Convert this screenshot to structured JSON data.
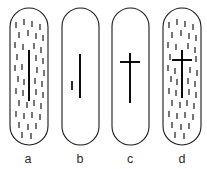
{
  "figure": {
    "background_color": "#ffffff",
    "outline_color": "#1a1a1a",
    "marker_color": "#000000",
    "texture_color": "#111111",
    "label_color": "#2b2b2b",
    "width": 207,
    "height": 169
  },
  "panels": [
    {
      "id": "a",
      "label": "a",
      "label_x": 28,
      "label_y": 163,
      "capsule": {
        "x": 10,
        "y": 8,
        "width": 38,
        "height": 137,
        "radius": 19
      },
      "has_texture": true,
      "has_center_line": true,
      "has_crossbar": false,
      "has_small_dash": false,
      "center_line": {
        "x": 29,
        "y1": 50,
        "y2": 101
      },
      "crossbar": null,
      "small_dash": null,
      "texture_dashes": [
        {
          "x": 16,
          "y1": 22,
          "y2": 28
        },
        {
          "x": 24,
          "y1": 19,
          "y2": 25
        },
        {
          "x": 32,
          "y1": 21,
          "y2": 27
        },
        {
          "x": 40,
          "y1": 24,
          "y2": 30
        },
        {
          "x": 19,
          "y1": 32,
          "y2": 38
        },
        {
          "x": 28,
          "y1": 30,
          "y2": 36
        },
        {
          "x": 36,
          "y1": 33,
          "y2": 39
        },
        {
          "x": 43,
          "y1": 35,
          "y2": 41
        },
        {
          "x": 15,
          "y1": 42,
          "y2": 48
        },
        {
          "x": 23,
          "y1": 44,
          "y2": 50
        },
        {
          "x": 34,
          "y1": 43,
          "y2": 49
        },
        {
          "x": 41,
          "y1": 47,
          "y2": 53
        },
        {
          "x": 17,
          "y1": 54,
          "y2": 60
        },
        {
          "x": 36,
          "y1": 55,
          "y2": 61
        },
        {
          "x": 43,
          "y1": 58,
          "y2": 64
        },
        {
          "x": 15,
          "y1": 65,
          "y2": 71
        },
        {
          "x": 22,
          "y1": 64,
          "y2": 70
        },
        {
          "x": 37,
          "y1": 67,
          "y2": 73
        },
        {
          "x": 44,
          "y1": 70,
          "y2": 76
        },
        {
          "x": 18,
          "y1": 76,
          "y2": 82
        },
        {
          "x": 24,
          "y1": 79,
          "y2": 85
        },
        {
          "x": 35,
          "y1": 78,
          "y2": 84
        },
        {
          "x": 42,
          "y1": 81,
          "y2": 87
        },
        {
          "x": 16,
          "y1": 88,
          "y2": 94
        },
        {
          "x": 23,
          "y1": 90,
          "y2": 96
        },
        {
          "x": 36,
          "y1": 89,
          "y2": 95
        },
        {
          "x": 43,
          "y1": 92,
          "y2": 98
        },
        {
          "x": 19,
          "y1": 100,
          "y2": 106
        },
        {
          "x": 27,
          "y1": 102,
          "y2": 108
        },
        {
          "x": 34,
          "y1": 100,
          "y2": 106
        },
        {
          "x": 41,
          "y1": 103,
          "y2": 109
        },
        {
          "x": 16,
          "y1": 111,
          "y2": 117
        },
        {
          "x": 24,
          "y1": 113,
          "y2": 119
        },
        {
          "x": 32,
          "y1": 112,
          "y2": 118
        },
        {
          "x": 40,
          "y1": 114,
          "y2": 120
        },
        {
          "x": 19,
          "y1": 122,
          "y2": 128
        },
        {
          "x": 28,
          "y1": 124,
          "y2": 130
        },
        {
          "x": 36,
          "y1": 123,
          "y2": 129
        },
        {
          "x": 22,
          "y1": 132,
          "y2": 138
        },
        {
          "x": 31,
          "y1": 133,
          "y2": 139
        }
      ]
    },
    {
      "id": "b",
      "label": "b",
      "label_x": 80,
      "label_y": 163,
      "capsule": {
        "x": 62,
        "y": 8,
        "width": 37,
        "height": 137,
        "radius": 18.5
      },
      "has_texture": false,
      "has_center_line": true,
      "has_crossbar": false,
      "has_small_dash": true,
      "center_line": {
        "x": 80,
        "y1": 54,
        "y2": 98
      },
      "crossbar": null,
      "small_dash": {
        "x": 72,
        "y1": 81,
        "y2": 90
      },
      "texture_dashes": []
    },
    {
      "id": "c",
      "label": "c",
      "label_x": 130,
      "label_y": 163,
      "capsule": {
        "x": 112,
        "y": 8,
        "width": 37,
        "height": 137,
        "radius": 18.5
      },
      "has_texture": false,
      "has_center_line": true,
      "has_crossbar": true,
      "has_small_dash": false,
      "center_line": {
        "x": 130,
        "y1": 53,
        "y2": 103
      },
      "crossbar": {
        "y": 62,
        "x1": 120,
        "x2": 140
      },
      "small_dash": null,
      "texture_dashes": []
    },
    {
      "id": "d",
      "label": "d",
      "label_x": 182,
      "label_y": 163,
      "capsule": {
        "x": 163,
        "y": 8,
        "width": 38,
        "height": 137,
        "radius": 19
      },
      "has_texture": true,
      "has_center_line": true,
      "has_crossbar": true,
      "has_small_dash": false,
      "center_line": {
        "x": 182,
        "y1": 50,
        "y2": 98
      },
      "crossbar": {
        "y": 60,
        "x1": 172,
        "x2": 192
      },
      "small_dash": null,
      "texture_dashes": [
        {
          "x": 169,
          "y1": 22,
          "y2": 28
        },
        {
          "x": 177,
          "y1": 19,
          "y2": 25
        },
        {
          "x": 185,
          "y1": 21,
          "y2": 27
        },
        {
          "x": 193,
          "y1": 24,
          "y2": 30
        },
        {
          "x": 172,
          "y1": 32,
          "y2": 38
        },
        {
          "x": 181,
          "y1": 30,
          "y2": 36
        },
        {
          "x": 189,
          "y1": 33,
          "y2": 39
        },
        {
          "x": 196,
          "y1": 35,
          "y2": 41
        },
        {
          "x": 168,
          "y1": 42,
          "y2": 48
        },
        {
          "x": 176,
          "y1": 44,
          "y2": 50
        },
        {
          "x": 188,
          "y1": 43,
          "y2": 49
        },
        {
          "x": 195,
          "y1": 47,
          "y2": 53
        },
        {
          "x": 170,
          "y1": 54,
          "y2": 60
        },
        {
          "x": 196,
          "y1": 56,
          "y2": 62
        },
        {
          "x": 168,
          "y1": 65,
          "y2": 71
        },
        {
          "x": 175,
          "y1": 68,
          "y2": 74
        },
        {
          "x": 190,
          "y1": 67,
          "y2": 73
        },
        {
          "x": 197,
          "y1": 70,
          "y2": 76
        },
        {
          "x": 171,
          "y1": 76,
          "y2": 82
        },
        {
          "x": 177,
          "y1": 79,
          "y2": 85
        },
        {
          "x": 188,
          "y1": 78,
          "y2": 84
        },
        {
          "x": 195,
          "y1": 81,
          "y2": 87
        },
        {
          "x": 169,
          "y1": 88,
          "y2": 94
        },
        {
          "x": 176,
          "y1": 90,
          "y2": 96
        },
        {
          "x": 189,
          "y1": 89,
          "y2": 95
        },
        {
          "x": 196,
          "y1": 92,
          "y2": 98
        },
        {
          "x": 172,
          "y1": 100,
          "y2": 106
        },
        {
          "x": 180,
          "y1": 102,
          "y2": 108
        },
        {
          "x": 187,
          "y1": 100,
          "y2": 106
        },
        {
          "x": 194,
          "y1": 103,
          "y2": 109
        },
        {
          "x": 169,
          "y1": 111,
          "y2": 117
        },
        {
          "x": 177,
          "y1": 113,
          "y2": 119
        },
        {
          "x": 185,
          "y1": 112,
          "y2": 118
        },
        {
          "x": 193,
          "y1": 114,
          "y2": 120
        },
        {
          "x": 172,
          "y1": 122,
          "y2": 128
        },
        {
          "x": 181,
          "y1": 124,
          "y2": 130
        },
        {
          "x": 189,
          "y1": 123,
          "y2": 129
        },
        {
          "x": 175,
          "y1": 132,
          "y2": 138
        },
        {
          "x": 184,
          "y1": 133,
          "y2": 139
        }
      ]
    }
  ]
}
